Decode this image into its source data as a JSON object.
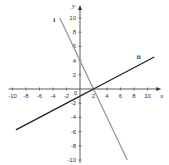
{
  "chart_data": {
    "type": "line",
    "title": "",
    "xlabel": "x",
    "ylabel": "y",
    "xlim": [
      -10,
      11
    ],
    "ylim": [
      -10,
      11
    ],
    "grid": false,
    "x_ticks": [
      -10,
      -8,
      -6,
      -4,
      -2,
      0,
      2,
      4,
      6,
      8,
      10
    ],
    "y_ticks": [
      -10,
      -8,
      -6,
      -4,
      -2,
      2,
      4,
      6,
      8,
      10
    ],
    "x_tick_labels": [
      "-10",
      "-8",
      "-6",
      "-4",
      "-2",
      "2",
      "4",
      "6",
      "8",
      "10"
    ],
    "y_tick_labels": [
      "10",
      "8",
      "6",
      "4",
      "2",
      "-2",
      "-4",
      "-6",
      "-8",
      "-10"
    ],
    "origin_label": "0",
    "series": [
      {
        "name": "i",
        "equation": "y = -2x + 4",
        "color": "#9a9a9a",
        "x": [
          -3,
          0,
          2,
          7
        ],
        "y": [
          10,
          4,
          0,
          -10
        ]
      },
      {
        "name": "ii",
        "equation": "y = 0.5x - 1",
        "color": "#222222",
        "x": [
          -9.5,
          0,
          2,
          11
        ],
        "y": [
          -5.75,
          -1,
          0,
          4.5
        ]
      }
    ],
    "annotations": [
      {
        "text": "i",
        "x": -3.8,
        "y": 9.5
      },
      {
        "text": "ii",
        "x": 8.7,
        "y": 4.2
      }
    ]
  }
}
